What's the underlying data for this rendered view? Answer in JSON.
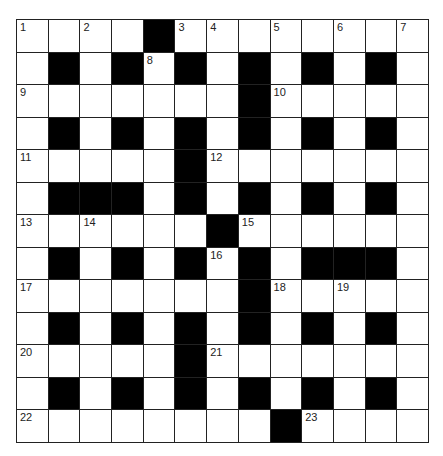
{
  "puzzle": {
    "rows": 13,
    "cols": 13,
    "colors": {
      "black": "#000000",
      "white": "#ffffff",
      "line": "#222222"
    },
    "grid": [
      "....#........",
      ".#.#.#.#.#.#.",
      ".......#.....",
      ".#.#.#.#.#.#.",
      ".....#.......",
      ".###.#.#.#.#.",
      "......#......",
      ".#.#.#.#.###.",
      ".......#.....",
      ".#.#.#.#.#.#.",
      ".....#.......",
      ".#.#.#.#.#.#.",
      "........#...."
    ],
    "numbers": [
      {
        "r": 0,
        "c": 0,
        "n": "1"
      },
      {
        "r": 0,
        "c": 2,
        "n": "2"
      },
      {
        "r": 0,
        "c": 5,
        "n": "3"
      },
      {
        "r": 0,
        "c": 6,
        "n": "4"
      },
      {
        "r": 0,
        "c": 8,
        "n": "5"
      },
      {
        "r": 0,
        "c": 10,
        "n": "6"
      },
      {
        "r": 0,
        "c": 12,
        "n": "7"
      },
      {
        "r": 1,
        "c": 4,
        "n": "8"
      },
      {
        "r": 2,
        "c": 0,
        "n": "9"
      },
      {
        "r": 2,
        "c": 8,
        "n": "10"
      },
      {
        "r": 4,
        "c": 0,
        "n": "11"
      },
      {
        "r": 4,
        "c": 6,
        "n": "12"
      },
      {
        "r": 6,
        "c": 0,
        "n": "13"
      },
      {
        "r": 6,
        "c": 2,
        "n": "14"
      },
      {
        "r": 6,
        "c": 7,
        "n": "15"
      },
      {
        "r": 7,
        "c": 6,
        "n": "16"
      },
      {
        "r": 8,
        "c": 0,
        "n": "17"
      },
      {
        "r": 8,
        "c": 8,
        "n": "18"
      },
      {
        "r": 8,
        "c": 10,
        "n": "19"
      },
      {
        "r": 10,
        "c": 0,
        "n": "20"
      },
      {
        "r": 10,
        "c": 6,
        "n": "21"
      },
      {
        "r": 12,
        "c": 0,
        "n": "22"
      },
      {
        "r": 12,
        "c": 9,
        "n": "23"
      }
    ]
  }
}
